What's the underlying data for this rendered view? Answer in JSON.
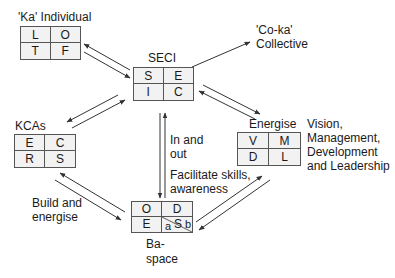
{
  "nodes": {
    "ka": {
      "title": "'Ka' Individual",
      "cells": [
        "L",
        "O",
        "T",
        "F"
      ]
    },
    "seci": {
      "title": "SECI",
      "cells": [
        "S",
        "E",
        "I",
        "C"
      ]
    },
    "coka": {
      "title_line1": "'Co-ka'",
      "title_line2": "Collective"
    },
    "kcas": {
      "title": "KCAs",
      "cells": [
        "E",
        "C",
        "R",
        "S"
      ]
    },
    "energise": {
      "title": "Energise",
      "cells": [
        "V",
        "M",
        "D",
        "L"
      ],
      "desc": [
        "Vision,",
        "Management,",
        "Development",
        "and Leadership"
      ]
    },
    "ba": {
      "title_line1": "Ba-",
      "title_line2": "space",
      "cells": [
        "O",
        "D",
        "E",
        "S"
      ],
      "sub_a": "a",
      "sub_b": "b"
    }
  },
  "edge_labels": {
    "in_out": [
      "In and",
      "out"
    ],
    "facilitate": [
      "Facilitate skills,",
      "awareness"
    ],
    "build": [
      "Build and",
      "energise"
    ]
  },
  "colors": {
    "line": "#333333",
    "cell_bg": "#f2f2f2",
    "border": "#555555"
  }
}
